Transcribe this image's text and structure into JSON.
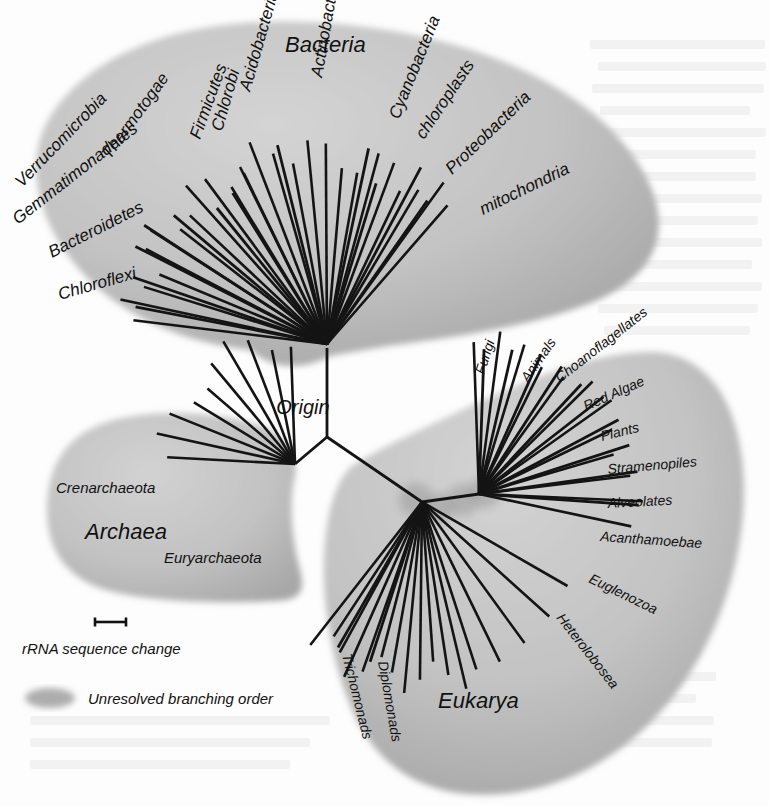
{
  "figure": {
    "type": "unrooted-phylogenetic-tree",
    "root_label": "Origin",
    "width": 769,
    "height": 806,
    "colors": {
      "blob_fill": "#c2c2c2",
      "blob_fill_light": "#cfcfcf",
      "blob_shadow": "#8f8f8f",
      "unresolved_node": "#9a9a9a",
      "branch": "#111111",
      "text": "#111111",
      "background": "#fdfdfd",
      "bleed_text": "#f0f0f0"
    }
  },
  "domains": [
    {
      "id": "bacteria",
      "name": "Bacteria",
      "label_x": 285,
      "label_y": 52,
      "label_rotate": 0,
      "label_size": 22,
      "node": {
        "x": 327,
        "y": 344
      },
      "branch_count": 25,
      "taxa": [
        {
          "name": "Chloroflexi",
          "angle": 191,
          "length": 195,
          "lx": 60,
          "ly": 300,
          "rot": -16,
          "size": 17
        },
        {
          "name": "Bacteroidetes",
          "angle": 199,
          "length": 205,
          "lx": 52,
          "ly": 258,
          "rot": -27,
          "size": 17
        },
        {
          "name": "Gemmatimonadetes",
          "angle": 207,
          "length": 215,
          "lx": 18,
          "ly": 225,
          "rot": -38,
          "size": 17
        },
        {
          "name": "Verrucomicrobia",
          "angle": 213,
          "length": 218,
          "lx": 22,
          "ly": 188,
          "rot": -46,
          "size": 17
        },
        {
          "name": "Thermotogae",
          "angle": 220,
          "length": 200,
          "lx": 110,
          "ly": 160,
          "rot": -54,
          "size": 17
        },
        {
          "name": "Firmicutes",
          "angle": 231,
          "length": 175,
          "lx": 200,
          "ly": 140,
          "rot": -70,
          "size": 17
        },
        {
          "name": "Chlorobi",
          "angle": 238,
          "length": 178,
          "lx": 222,
          "ly": 132,
          "rot": -74,
          "size": 17
        },
        {
          "name": "Acidobacteria",
          "angle": 244,
          "length": 190,
          "lx": 250,
          "ly": 92,
          "rot": -74,
          "size": 17
        },
        {
          "name": "Actinobacteria",
          "angle": 256,
          "length": 205,
          "lx": 322,
          "ly": 78,
          "rot": -80,
          "size": 17
        },
        {
          "name": "Cyanobacteria",
          "angle": 282,
          "length": 200,
          "lx": 399,
          "ly": 120,
          "rot": -68,
          "size": 17
        },
        {
          "name": "chloroplasts",
          "angle": 287,
          "length": 168,
          "lx": 424,
          "ly": 140,
          "rot": -56,
          "size": 17
        },
        {
          "name": "Proteobacteria",
          "angle": 298,
          "length": 200,
          "lx": 452,
          "ly": 175,
          "rot": -44,
          "size": 17
        },
        {
          "name": "mitochondria",
          "angle": 305,
          "length": 175,
          "lx": 483,
          "ly": 215,
          "rot": -26,
          "size": 17
        }
      ]
    },
    {
      "id": "archaea",
      "name": "Archaea",
      "label_x": 85,
      "label_y": 539,
      "label_rotate": 0,
      "label_size": 22,
      "node": {
        "x": 295,
        "y": 464
      },
      "branch_count": 10,
      "taxa": [
        {
          "name": "Crenarchaeota",
          "angle": 192,
          "length": 125,
          "lx": 56,
          "ly": 493,
          "rot": 0,
          "size": 15
        },
        {
          "name": "Euryarchaeota",
          "angle": 250,
          "length": 110,
          "lx": 164,
          "ly": 563,
          "rot": 0,
          "size": 15
        }
      ]
    },
    {
      "id": "eukarya",
      "name": "Eukarya",
      "label_x": 438,
      "label_y": 708,
      "label_rotate": 0,
      "label_size": 22,
      "node_left": {
        "x": 422,
        "y": 502
      },
      "node_right": {
        "x": 479,
        "y": 494
      },
      "branch_count_left": 13,
      "branch_count_right": 12,
      "taxa": [
        {
          "name": "Fungi",
          "angle": 272,
          "length": 145,
          "lx": 484,
          "ly": 375,
          "rot": -72,
          "size": 14
        },
        {
          "name": "Animals",
          "angle": 283,
          "length": 148,
          "lx": 528,
          "ly": 383,
          "rot": -55,
          "size": 14
        },
        {
          "name": "Choanoflagellates",
          "angle": 294,
          "length": 152,
          "lx": 560,
          "ly": 383,
          "rot": -38,
          "size": 14
        },
        {
          "name": "Red Algae",
          "angle": 303,
          "length": 152,
          "lx": 586,
          "ly": 411,
          "rot": -24,
          "size": 14
        },
        {
          "name": "Plants",
          "angle": 313,
          "length": 150,
          "lx": 602,
          "ly": 441,
          "rot": -14,
          "size": 14
        },
        {
          "name": "Stramenopiles",
          "angle": 322,
          "length": 158,
          "lx": 608,
          "ly": 474,
          "rot": -5,
          "size": 14
        },
        {
          "name": "Alveolates",
          "angle": 332,
          "length": 158,
          "lx": 608,
          "ly": 508,
          "rot": -3,
          "size": 14
        },
        {
          "name": "Acanthamoebae",
          "angle": 342,
          "length": 158,
          "lx": 600,
          "ly": 541,
          "rot": 4,
          "size": 14
        },
        {
          "name": "Euglenozoa",
          "angle": 352,
          "length": 160,
          "lx": 588,
          "ly": 582,
          "rot": 26,
          "size": 14
        },
        {
          "name": "Heterolobosea",
          "angle": 4,
          "length": 160,
          "lx": 556,
          "ly": 618,
          "rot": 52,
          "size": 14
        },
        {
          "name": "Diplomonads",
          "angle": 108,
          "length": 168,
          "lx": 378,
          "ly": 662,
          "rot": 80,
          "size": 14
        },
        {
          "name": "Trichomonads",
          "angle": 120,
          "length": 168,
          "lx": 342,
          "ly": 655,
          "rot": 76,
          "size": 14
        }
      ]
    }
  ],
  "legend": {
    "scale_bar": {
      "x1": 95,
      "x2": 126,
      "y": 622,
      "cap_height": 9
    },
    "scale_label": "rRNA sequence change",
    "scale_label_x": 22,
    "scale_label_y": 654,
    "unresolved_swatch": {
      "cx": 50,
      "cy": 698,
      "rx": 25,
      "ry": 10
    },
    "unresolved_label": "Unresolved branching order",
    "unresolved_label_x": 88,
    "unresolved_label_y": 704,
    "label_size": 15
  },
  "bleed_through": {
    "note": "faint reverse-side print visible on scanned page",
    "lines": [
      {
        "x": 590,
        "y": 40,
        "w": 175,
        "h": 9
      },
      {
        "x": 598,
        "y": 62,
        "w": 168,
        "h": 9
      },
      {
        "x": 592,
        "y": 84,
        "w": 172,
        "h": 9
      },
      {
        "x": 600,
        "y": 106,
        "w": 150,
        "h": 9
      },
      {
        "x": 590,
        "y": 128,
        "w": 176,
        "h": 9
      },
      {
        "x": 596,
        "y": 150,
        "w": 160,
        "h": 9
      },
      {
        "x": 604,
        "y": 172,
        "w": 152,
        "h": 9
      },
      {
        "x": 592,
        "y": 194,
        "w": 170,
        "h": 9
      },
      {
        "x": 600,
        "y": 216,
        "w": 158,
        "h": 9
      },
      {
        "x": 596,
        "y": 238,
        "w": 166,
        "h": 9
      },
      {
        "x": 602,
        "y": 260,
        "w": 150,
        "h": 9
      },
      {
        "x": 590,
        "y": 282,
        "w": 172,
        "h": 9
      },
      {
        "x": 598,
        "y": 304,
        "w": 160,
        "h": 9
      },
      {
        "x": 604,
        "y": 326,
        "w": 146,
        "h": 9
      },
      {
        "x": 30,
        "y": 716,
        "w": 300,
        "h": 9
      },
      {
        "x": 30,
        "y": 738,
        "w": 280,
        "h": 9
      },
      {
        "x": 30,
        "y": 760,
        "w": 260,
        "h": 9
      },
      {
        "x": 560,
        "y": 650,
        "w": 140,
        "h": 9
      },
      {
        "x": 566,
        "y": 672,
        "w": 150,
        "h": 9
      },
      {
        "x": 560,
        "y": 694,
        "w": 136,
        "h": 9
      },
      {
        "x": 570,
        "y": 716,
        "w": 144,
        "h": 9
      },
      {
        "x": 560,
        "y": 738,
        "w": 152,
        "h": 9
      }
    ]
  }
}
